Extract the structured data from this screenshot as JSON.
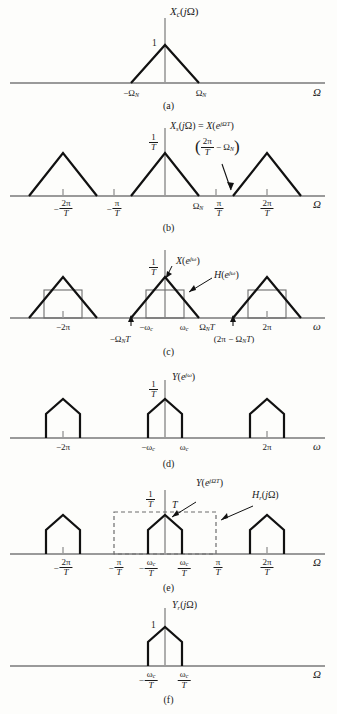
{
  "figure": {
    "background": "#fdfdfb",
    "curve_color": "#111111",
    "axis_color": "#9a9a9a",
    "filter_color": "#6d6d6d",
    "panel_count": 6
  },
  "panels": [
    {
      "letter": "(a)",
      "title_parts": {
        "main": "X",
        "sub": "c",
        "arg": "(jΩ)"
      },
      "title_plain": "X_c(jΩ)",
      "x_axis_label": "Ω",
      "peak_label": "1",
      "ticks": [
        {
          "label_plain": "−Ω_N",
          "type": "neg-omega-n"
        },
        {
          "label_plain": "Ω_N",
          "type": "omega-n"
        }
      ],
      "shape": "single-triangle"
    },
    {
      "letter": "(b)",
      "title_plain": "X_s(jΩ) = X(e^{jΩT})",
      "x_axis_label": "Ω",
      "peak_label_plain": "1/T",
      "annotation_plain": "(2π/T − Ω_N)",
      "ticks": [
        {
          "label_plain": "−2π/T"
        },
        {
          "label_plain": "−π/T"
        },
        {
          "label_plain": "Ω_N"
        },
        {
          "label_plain": "π/T"
        },
        {
          "label_plain": "2π/T"
        }
      ],
      "shape": "periodic-triangles"
    },
    {
      "letter": "(c)",
      "x_axis_label": "ω",
      "peak_label_plain": "1/T",
      "signal_label_plain": "X(e^{jω})",
      "filter_label_plain": "H(e^{jω})",
      "ticks": [
        {
          "label_plain": "−2π"
        },
        {
          "label_plain": "−Ω_N T"
        },
        {
          "label_plain": "−ω_c"
        },
        {
          "label_plain": "ω_c"
        },
        {
          "label_plain": "Ω_N T"
        },
        {
          "label_plain": "(2π − Ω_N T)"
        },
        {
          "label_plain": "2π"
        }
      ],
      "shape": "triangles-with-lowpass-rectangles"
    },
    {
      "letter": "(d)",
      "title_plain": "Y(e^{jω})",
      "x_axis_label": "ω",
      "peak_label_plain": "1/T",
      "ticks": [
        {
          "label_plain": "−2π"
        },
        {
          "label_plain": "−ω_c"
        },
        {
          "label_plain": "ω_c"
        },
        {
          "label_plain": "2π"
        }
      ],
      "shape": "truncated-triangles"
    },
    {
      "letter": "(e)",
      "x_axis_label": "Ω",
      "peak_label_plain": "1/T",
      "gain_label_plain": "T",
      "signal_label_plain": "Y(e^{jΩT})",
      "filter_label_plain": "H_r(jΩ)",
      "ticks": [
        {
          "label_plain": "−2π/T"
        },
        {
          "label_plain": "−π/T"
        },
        {
          "label_plain": "−ω_c/T"
        },
        {
          "label_plain": "ω_c/T"
        },
        {
          "label_plain": "π/T"
        },
        {
          "label_plain": "2π/T"
        }
      ],
      "shape": "truncated-triangles-with-dashed-reconstruction-filter"
    },
    {
      "letter": "(f)",
      "title_plain": "Y_r(jΩ)",
      "x_axis_label": "Ω",
      "peak_label": "1",
      "ticks": [
        {
          "label_plain": "−ω_c/T"
        },
        {
          "label_plain": "ω_c/T"
        }
      ],
      "shape": "single-truncated-triangle"
    }
  ],
  "symbols": {
    "omega_cap": "Ω",
    "omega_low": "ω",
    "pi": "π",
    "minus": "−",
    "two_pi": "2π",
    "T": "T",
    "one": "1",
    "N": "N",
    "c": "c",
    "r": "r",
    "s": "s"
  }
}
